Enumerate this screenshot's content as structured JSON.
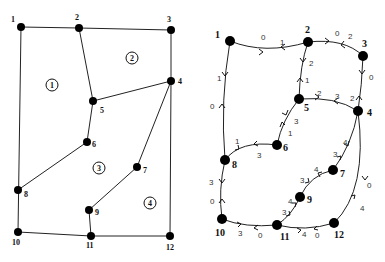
{
  "left_diagram": {
    "title": "Planar mesh with regions",
    "nodes": [
      {
        "id": "1",
        "label": "1",
        "x": 21,
        "y": 27,
        "lx": 11,
        "ly": 22
      },
      {
        "id": "2",
        "label": "2",
        "x": 79,
        "y": 28,
        "lx": 75,
        "ly": 20
      },
      {
        "id": "3",
        "label": "3",
        "x": 171,
        "y": 30,
        "lx": 167,
        "ly": 22
      },
      {
        "id": "4",
        "label": "4",
        "x": 171,
        "y": 81,
        "lx": 178,
        "ly": 84
      },
      {
        "id": "5",
        "label": "5",
        "x": 93,
        "y": 101,
        "lx": 100,
        "ly": 113
      },
      {
        "id": "6",
        "label": "6",
        "x": 87,
        "y": 142,
        "lx": 92,
        "ly": 147
      },
      {
        "id": "7",
        "label": "7",
        "x": 137,
        "y": 167,
        "lx": 143,
        "ly": 173
      },
      {
        "id": "8",
        "label": "8",
        "x": 18,
        "y": 190,
        "lx": 24,
        "ly": 197
      },
      {
        "id": "9",
        "label": "9",
        "x": 89,
        "y": 210,
        "lx": 95,
        "ly": 215
      },
      {
        "id": "10",
        "label": "10",
        "x": 18,
        "y": 232,
        "lx": 12,
        "ly": 245
      },
      {
        "id": "11",
        "label": "11",
        "x": 91,
        "y": 236,
        "lx": 86,
        "ly": 248
      },
      {
        "id": "12",
        "label": "12",
        "x": 170,
        "y": 236,
        "lx": 166,
        "ly": 250
      }
    ],
    "edges": [
      [
        "1",
        "2"
      ],
      [
        "2",
        "3"
      ],
      [
        "3",
        "4"
      ],
      [
        "2",
        "5"
      ],
      [
        "5",
        "4"
      ],
      [
        "5",
        "6"
      ],
      [
        "6",
        "8"
      ],
      [
        "1",
        "10"
      ],
      [
        "4",
        "7"
      ],
      [
        "7",
        "9"
      ],
      [
        "9",
        "11"
      ],
      [
        "4",
        "12"
      ],
      [
        "10",
        "11"
      ],
      [
        "11",
        "12"
      ]
    ],
    "regions": [
      {
        "label": "1",
        "x": 52,
        "y": 85
      },
      {
        "label": "2",
        "x": 132,
        "y": 58
      },
      {
        "label": "3",
        "x": 99,
        "y": 168
      },
      {
        "label": "4",
        "x": 150,
        "y": 203
      }
    ]
  },
  "right_diagram": {
    "title": "Directed weighted graph",
    "nodes": [
      {
        "id": "1",
        "label": "1",
        "x": 230,
        "y": 41,
        "lx": 215,
        "ly": 38
      },
      {
        "id": "2",
        "label": "2",
        "x": 308,
        "y": 42,
        "lx": 305,
        "ly": 33
      },
      {
        "id": "3",
        "label": "3",
        "x": 363,
        "y": 56,
        "lx": 362,
        "ly": 47
      },
      {
        "id": "4",
        "label": "4",
        "x": 358,
        "y": 111,
        "lx": 367,
        "ly": 116
      },
      {
        "id": "5",
        "label": "5",
        "x": 299,
        "y": 99,
        "lx": 304,
        "ly": 111
      },
      {
        "id": "6",
        "label": "6",
        "x": 277,
        "y": 145,
        "lx": 283,
        "ly": 151
      },
      {
        "id": "7",
        "label": "7",
        "x": 333,
        "y": 170,
        "lx": 340,
        "ly": 177
      },
      {
        "id": "8",
        "label": "8",
        "x": 225,
        "y": 160,
        "lx": 232,
        "ly": 168
      },
      {
        "id": "9",
        "label": "9",
        "x": 300,
        "y": 197,
        "lx": 307,
        "ly": 203
      },
      {
        "id": "10",
        "label": "10",
        "x": 222,
        "y": 219,
        "lx": 215,
        "ly": 236
      },
      {
        "id": "11",
        "label": "11",
        "x": 277,
        "y": 225,
        "lx": 280,
        "ly": 240
      },
      {
        "id": "12",
        "label": "12",
        "x": 334,
        "y": 223,
        "lx": 334,
        "ly": 238
      }
    ],
    "edge_weights": [
      {
        "text": "0",
        "x": 261,
        "y": 40
      },
      {
        "text": "1",
        "x": 280,
        "y": 45
      },
      {
        "text": "0",
        "x": 335,
        "y": 36
      },
      {
        "text": "2",
        "x": 348,
        "y": 39
      },
      {
        "text": "2",
        "x": 309,
        "y": 66
      },
      {
        "text": "1",
        "x": 305,
        "y": 83
      },
      {
        "text": "0",
        "x": 369,
        "y": 80
      },
      {
        "text": "2",
        "x": 350,
        "y": 101
      },
      {
        "text": "2",
        "x": 317,
        "y": 96
      },
      {
        "text": "3",
        "x": 335,
        "y": 99
      },
      {
        "text": "1",
        "x": 217,
        "y": 81
      },
      {
        "text": "0",
        "x": 210,
        "y": 109
      },
      {
        "text": "3",
        "x": 294,
        "y": 124
      },
      {
        "text": "1",
        "x": 288,
        "y": 136
      },
      {
        "text": "1",
        "x": 235,
        "y": 144
      },
      {
        "text": "3",
        "x": 257,
        "y": 158
      },
      {
        "text": "4",
        "x": 343,
        "y": 145
      },
      {
        "text": "3",
        "x": 333,
        "y": 157
      },
      {
        "text": "4",
        "x": 314,
        "y": 172
      },
      {
        "text": "3",
        "x": 300,
        "y": 183
      },
      {
        "text": "3",
        "x": 209,
        "y": 185
      },
      {
        "text": "0",
        "x": 210,
        "y": 204
      },
      {
        "text": "4",
        "x": 288,
        "y": 204
      },
      {
        "text": "3",
        "x": 282,
        "y": 215
      },
      {
        "text": "0",
        "x": 367,
        "y": 188
      },
      {
        "text": "4",
        "x": 360,
        "y": 211
      },
      {
        "text": "3",
        "x": 238,
        "y": 236
      },
      {
        "text": "0",
        "x": 258,
        "y": 238
      },
      {
        "text": "4",
        "x": 302,
        "y": 237
      },
      {
        "text": "0",
        "x": 315,
        "y": 238
      }
    ]
  }
}
